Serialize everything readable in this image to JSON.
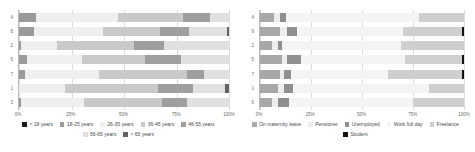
{
  "chart_data": [
    {
      "type": "bar",
      "orientation": "horizontal",
      "stacked": true,
      "normalized": true,
      "title": "",
      "xlabel": "",
      "ylabel": "",
      "xlim": [
        0,
        100
      ],
      "xticks": [
        "0%",
        "25%",
        "50%",
        "75%",
        "100%"
      ],
      "xtick_values": [
        0,
        25,
        50,
        75,
        100
      ],
      "grid": true,
      "legend_position": "bottom",
      "categories": [
        "4",
        "8",
        "2",
        "6",
        "7",
        "1",
        "3"
      ],
      "series": [
        {
          "name": "< 18 years",
          "color": "#1a1a1a",
          "values": [
            0,
            0,
            0,
            0,
            0,
            0,
            0
          ]
        },
        {
          "name": "18-25 years",
          "color": "#9a9a9a",
          "values": [
            8,
            7,
            1,
            4,
            3,
            0,
            1
          ]
        },
        {
          "name": "26-35 years",
          "color": "#efefef",
          "values": [
            39,
            33,
            17,
            26,
            35,
            22,
            30
          ]
        },
        {
          "name": "36-45 years",
          "color": "#c9c9c9",
          "values": [
            31,
            27,
            37,
            30,
            42,
            44,
            37
          ]
        },
        {
          "name": "46-55 years",
          "color": "#9f9f9f",
          "values": [
            13,
            14,
            14,
            17,
            8,
            17,
            12
          ]
        },
        {
          "name": "56-65 years",
          "color": "#e0e0e0",
          "values": [
            9,
            18,
            31,
            23,
            12,
            15,
            20
          ]
        },
        {
          "name": "> 65 years",
          "color": "#636363",
          "values": [
            0,
            1,
            0,
            0,
            0,
            2,
            0
          ]
        }
      ]
    },
    {
      "type": "bar",
      "orientation": "horizontal",
      "stacked": true,
      "normalized": true,
      "title": "",
      "xlabel": "",
      "ylabel": "",
      "xlim": [
        0,
        100
      ],
      "xticks": [
        "0%",
        "25%",
        "50%",
        "75%",
        "100%"
      ],
      "xtick_values": [
        0,
        25,
        50,
        75,
        100
      ],
      "grid": true,
      "legend_position": "bottom",
      "categories": [
        "4",
        "9",
        "2",
        "5",
        "7",
        "1",
        "6"
      ],
      "series": [
        {
          "name": "On maternity leave",
          "color": "#a8a8a8",
          "values": [
            7,
            10,
            6,
            11,
            10,
            9,
            6
          ]
        },
        {
          "name": "Pensioner",
          "color": "#ededed",
          "values": [
            3,
            3,
            3,
            2,
            2,
            3,
            3
          ]
        },
        {
          "name": "Unemployed",
          "color": "#8f8f8f",
          "values": [
            3,
            5,
            2,
            7,
            3,
            4,
            5
          ]
        },
        {
          "name": "Work full day",
          "color": "#f4f4f4",
          "values": [
            65,
            52,
            58,
            51,
            48,
            67,
            61
          ]
        },
        {
          "name": "Freelance",
          "color": "#cfcfcf",
          "values": [
            22,
            29,
            31,
            28,
            36,
            17,
            25
          ]
        },
        {
          "name": "Student",
          "color": "#111111",
          "values": [
            0,
            1,
            0,
            1,
            1,
            0,
            0
          ]
        }
      ]
    }
  ]
}
